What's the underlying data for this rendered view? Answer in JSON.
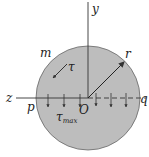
{
  "diagram": {
    "labels": {
      "y_axis": "y",
      "z_axis": "z",
      "origin": "O",
      "radius": "r",
      "point_m": "m",
      "point_p": "p",
      "point_q": "q",
      "tau": "τ",
      "tau_max_base": "τ",
      "tau_max_sub": "max"
    },
    "colors": {
      "circle_fill": "#bdbdbd",
      "circle_stroke": "#555555",
      "line": "#333333"
    }
  }
}
